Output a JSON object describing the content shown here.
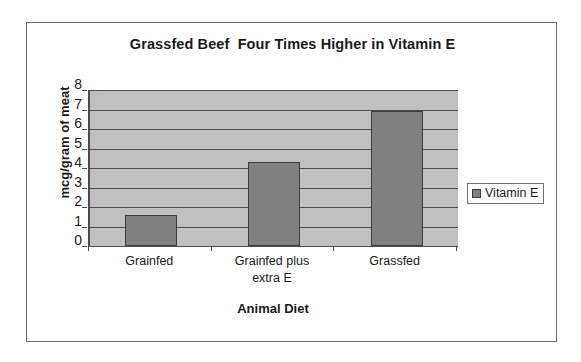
{
  "chart_data": {
    "type": "bar",
    "title": "Grassfed Beef  Four Times Higher in Vitamin E",
    "xlabel": "Animal Diet",
    "ylabel": "mcg/gram of meat",
    "categories": [
      "Grainfed",
      "Grainfed plus extra E",
      "Grassfed"
    ],
    "category_lines": [
      [
        "Grainfed"
      ],
      [
        "Grainfed plus",
        "extra E"
      ],
      [
        "Grassfed"
      ]
    ],
    "series": [
      {
        "name": "Vitamin E",
        "values": [
          1.6,
          4.3,
          6.9
        ],
        "color": "#808080"
      }
    ],
    "values": [
      1.6,
      4.3,
      6.9
    ],
    "ylim": [
      0,
      8
    ],
    "ytick_values": [
      0,
      1,
      2,
      3,
      4,
      5,
      6,
      7,
      8
    ],
    "ytick_labels": [
      "0",
      "1",
      "2",
      "3",
      "4",
      "5",
      "6",
      "7",
      "8"
    ],
    "grid": true,
    "grid_axis": "y",
    "legend": {
      "position": "right",
      "entries": [
        {
          "label": "Vitamin E",
          "swatch_color": "#808080"
        }
      ]
    },
    "plot_background": "#c0c0c0",
    "frame_background": "#ffffff",
    "axis_color": "#4d4d4d",
    "bar_edge_color": "#3d3d3d"
  },
  "legend": {
    "entry_label": "Vitamin E"
  }
}
